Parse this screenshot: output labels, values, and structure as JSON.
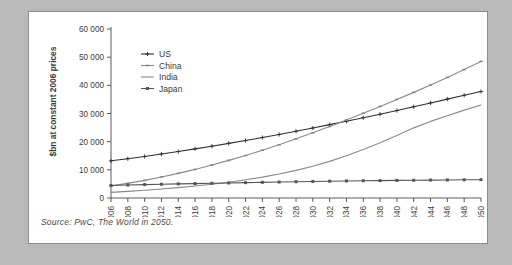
{
  "figure": {
    "source_note": "Source: PwC, The World in 2050.",
    "background_color": "#b9b9b9",
    "card_color": "#ffffff",
    "border_color": "#8d8d8d"
  },
  "chart_data": {
    "type": "line",
    "title": "",
    "subtitle": "",
    "xlabel": "",
    "ylabel": "$bn at constant 2006 prices",
    "xlim": [
      2006,
      2050
    ],
    "ylim": [
      0,
      60000
    ],
    "grid": false,
    "legend_position": "top-left",
    "ytick_labels": [
      "0",
      "10 000",
      "20 000",
      "30 000",
      "40 000",
      "50 000",
      "60 000"
    ],
    "ytick_values": [
      0,
      10000,
      20000,
      30000,
      40000,
      50000,
      60000
    ],
    "x": [
      2006,
      2008,
      2010,
      2012,
      2014,
      2016,
      2018,
      2020,
      2022,
      2024,
      2026,
      2028,
      2030,
      2032,
      2034,
      2036,
      2038,
      2040,
      2042,
      2044,
      2046,
      2048,
      2050
    ],
    "xtick_labels": [
      "2006",
      "2008",
      "2010",
      "2012",
      "2014",
      "2016",
      "2018",
      "2020",
      "2022",
      "2024",
      "2026",
      "2028",
      "2030",
      "2032",
      "2034",
      "2036",
      "2038",
      "2040",
      "2042",
      "2044",
      "2046",
      "2048",
      "2050"
    ],
    "xtick_rotation": 90,
    "series": [
      {
        "name": "US",
        "color": "#2f2f2f",
        "marker": "plus",
        "values": [
          13200,
          13950,
          14750,
          15600,
          16500,
          17450,
          18400,
          19400,
          20400,
          21450,
          22550,
          23700,
          24850,
          26050,
          27250,
          28500,
          29750,
          31050,
          32400,
          33750,
          35100,
          36450,
          37800
        ]
      },
      {
        "name": "China",
        "color": "#8a8a8a",
        "marker": "dash",
        "values": [
          4300,
          5200,
          6250,
          7450,
          8750,
          10150,
          11700,
          13350,
          15100,
          16950,
          18900,
          21000,
          23150,
          25400,
          27700,
          30100,
          32500,
          35000,
          37500,
          40100,
          42800,
          45600,
          48500
        ]
      },
      {
        "name": "India",
        "color": "#8a8a8a",
        "marker": "line",
        "values": [
          2000,
          2350,
          2750,
          3200,
          3700,
          4250,
          4900,
          5600,
          6450,
          7400,
          8500,
          9800,
          11300,
          13000,
          15000,
          17200,
          19600,
          22200,
          24900,
          27200,
          29200,
          31200,
          33000
        ]
      },
      {
        "name": "Japan",
        "color": "#555555",
        "marker": "square",
        "values": [
          4450,
          4600,
          4750,
          4880,
          5000,
          5120,
          5230,
          5340,
          5450,
          5560,
          5670,
          5780,
          5880,
          5970,
          6050,
          6120,
          6180,
          6240,
          6300,
          6360,
          6410,
          6460,
          6500
        ]
      }
    ]
  }
}
